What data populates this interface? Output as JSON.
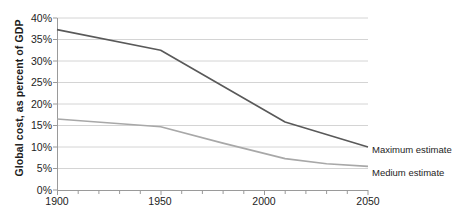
{
  "chart_data": {
    "type": "line",
    "title": "",
    "xlabel": "",
    "ylabel": "Global cost, as percent of GDP",
    "xlim": [
      1900,
      2050
    ],
    "ylim": [
      0,
      40
    ],
    "y_tick_labels": [
      "0%",
      "5%",
      "10%",
      "15%",
      "20%",
      "25%",
      "30%",
      "35%",
      "40%"
    ],
    "y_tick_values": [
      0,
      5,
      10,
      15,
      20,
      25,
      30,
      35,
      40
    ],
    "x_tick_labels": [
      "1900",
      "1950",
      "2000",
      "2050"
    ],
    "x_tick_values": [
      1900,
      1950,
      2000,
      2050
    ],
    "x_minor_tick_step": 10,
    "grid": "horizontal",
    "legend_position": "right-of-line-ends",
    "series": [
      {
        "name": "Maximum estimate",
        "color": "#595959",
        "x": [
          1900,
          1950,
          2010,
          2050
        ],
        "values": [
          37.3,
          32.5,
          15.8,
          10.0
        ]
      },
      {
        "name": "Medium estimate",
        "color": "#a8a8a8",
        "x": [
          1900,
          1950,
          1980,
          2010,
          2030,
          2050
        ],
        "values": [
          16.5,
          14.7,
          10.9,
          7.3,
          6.1,
          5.5
        ]
      }
    ]
  },
  "axes": {
    "y_label": "Global cost, as percent of GDP",
    "y_ticks": [
      "40%",
      "35%",
      "30%",
      "25%",
      "20%",
      "15%",
      "10%",
      "5%",
      "0%"
    ],
    "x_ticks": [
      "1900",
      "1950",
      "2000",
      "2050"
    ]
  },
  "legend": {
    "maximum": "Maximum estimate",
    "medium": "Medium estimate"
  },
  "caption": {
    "cropped_line": ""
  },
  "colors": {
    "maximum_line": "#595959",
    "medium_line": "#a8a8a8",
    "gridline": "#d4d4d4",
    "axis": "#9a9a9a",
    "text": "#1d1d1d"
  }
}
